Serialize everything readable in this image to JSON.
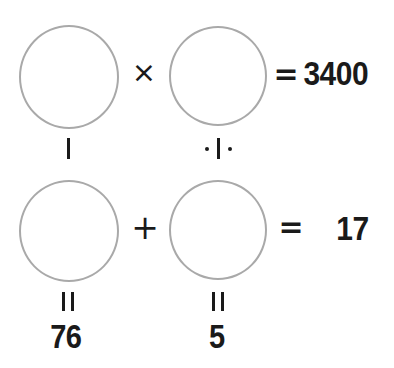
{
  "puzzle": {
    "title": "Circle arithmetic puzzle",
    "background_color": "#ffffff",
    "circle_stroke_color": "#a9a9a9",
    "text_color": "#1a1a1a",
    "row1": {
      "left_circle": "",
      "operator": "×",
      "right_circle": "",
      "equals": "=",
      "result": "3400"
    },
    "row2": {
      "left_circle": "",
      "operator": "+",
      "right_circle": "",
      "equals": "=",
      "result": "17"
    },
    "connectors": {
      "left_column": "|",
      "right_column": "·|·"
    },
    "labels": {
      "left_equals": "||",
      "left_value": "76",
      "right_equals": "||",
      "right_value": "5"
    }
  }
}
